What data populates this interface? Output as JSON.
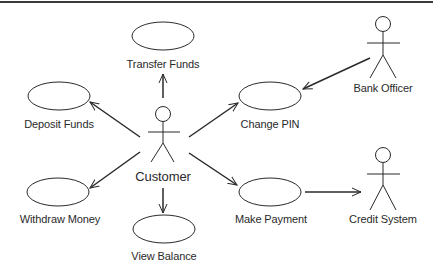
{
  "diagram": {
    "type": "UML use case diagram",
    "actors": [
      {
        "id": "customer",
        "label": "Customer"
      },
      {
        "id": "bank_officer",
        "label": "Bank Officer"
      },
      {
        "id": "credit_system",
        "label": "Credit System"
      }
    ],
    "use_cases": [
      {
        "id": "transfer_funds",
        "label": "Transfer Funds"
      },
      {
        "id": "deposit_funds",
        "label": "Deposit Funds"
      },
      {
        "id": "change_pin",
        "label": "Change PIN"
      },
      {
        "id": "withdraw_money",
        "label": "Withdraw Money"
      },
      {
        "id": "view_balance",
        "label": "View Balance"
      },
      {
        "id": "make_payment",
        "label": "Make Payment"
      }
    ],
    "associations": [
      {
        "from": "Customer",
        "to": "Transfer Funds"
      },
      {
        "from": "Customer",
        "to": "Deposit Funds"
      },
      {
        "from": "Customer",
        "to": "Change PIN"
      },
      {
        "from": "Customer",
        "to": "Withdraw Money"
      },
      {
        "from": "Customer",
        "to": "View Balance"
      },
      {
        "from": "Customer",
        "to": "Make Payment"
      },
      {
        "from": "Bank Officer",
        "to": "Change PIN"
      },
      {
        "from": "Make Payment",
        "to": "Credit System"
      }
    ]
  }
}
